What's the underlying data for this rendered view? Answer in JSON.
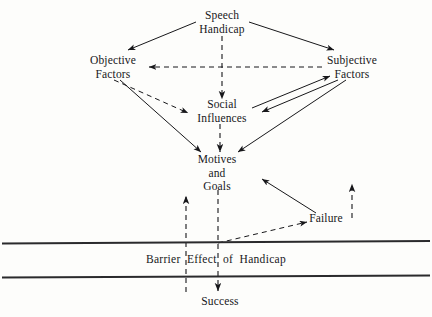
{
  "diagram": {
    "title": "Barrier Effect of Handicap",
    "canvas": {
      "width": 432,
      "height": 317,
      "background": "#fdfdfb"
    },
    "ink_color": "#17171a",
    "nodes": [
      {
        "id": "speech-handicap",
        "label": "Speech\nHandicap",
        "x": 222,
        "y": 19
      },
      {
        "id": "objective-factors",
        "label": "Objective\nFactors",
        "x": 113,
        "y": 64
      },
      {
        "id": "subjective-factors",
        "label": "Subjective\nFactors",
        "x": 352,
        "y": 64
      },
      {
        "id": "social-influences",
        "label": "Social\nInfluences",
        "x": 222,
        "y": 108
      },
      {
        "id": "motives-and-goals",
        "label": "Motives\nand\nGoals",
        "x": 217,
        "y": 163
      },
      {
        "id": "failure",
        "label": "Failure",
        "x": 326,
        "y": 219
      },
      {
        "id": "success",
        "label": "Success",
        "x": 220,
        "y": 302
      }
    ],
    "band": {
      "label": "Barrier  Effect  of  Handicap",
      "top_line_y": 243,
      "bottom_line_y": 277,
      "label_y": 260
    },
    "edges": [
      {
        "id": "speech-to-objective",
        "style": "solid",
        "from": "speech-handicap",
        "to": "objective-factors"
      },
      {
        "id": "speech-to-subjective",
        "style": "solid",
        "from": "speech-handicap",
        "to": "subjective-factors"
      },
      {
        "id": "speech-to-social",
        "style": "dashed",
        "from": "speech-handicap",
        "to": "social-influences"
      },
      {
        "id": "subjective-to-objective",
        "style": "dashed",
        "from": "subjective-factors",
        "to": "objective-factors"
      },
      {
        "id": "objective-to-social",
        "style": "dashed",
        "from": "objective-factors",
        "to": "social-influences"
      },
      {
        "id": "subjective-to-social",
        "style": "solid",
        "from": "subjective-factors",
        "to": "social-influences"
      },
      {
        "id": "social-to-subjective",
        "style": "solid",
        "from": "social-influences",
        "to": "subjective-factors"
      },
      {
        "id": "objective-to-motives",
        "style": "solid",
        "from": "objective-factors",
        "to": "motives-and-goals"
      },
      {
        "id": "social-to-motives",
        "style": "dashed",
        "from": "social-influences",
        "to": "motives-and-goals"
      },
      {
        "id": "subjective-to-motives",
        "style": "solid",
        "from": "subjective-factors",
        "to": "motives-and-goals"
      },
      {
        "id": "failure-to-motives",
        "style": "solid",
        "from": "failure",
        "to": "motives-and-goals"
      },
      {
        "id": "barrier-to-failure",
        "style": "dashed",
        "from": "band",
        "to": "failure"
      },
      {
        "id": "failure-feedback-up",
        "style": "dashed",
        "from": "below-failure",
        "to": "failure"
      },
      {
        "id": "success-feedback-up",
        "style": "dashed",
        "from": "success",
        "to": "motives-and-goals"
      },
      {
        "id": "motives-to-success",
        "style": "dashed",
        "from": "motives-and-goals",
        "to": "success"
      }
    ]
  }
}
